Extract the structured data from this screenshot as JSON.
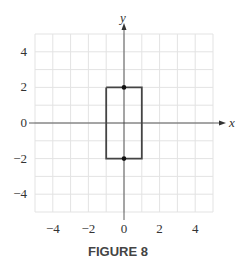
{
  "caption": "FIGURE 8",
  "chart_data": {
    "type": "line",
    "title": "FIGURE 8",
    "xlabel": "x",
    "ylabel": "y",
    "xlim": [
      -5,
      5
    ],
    "ylim": [
      -5,
      5
    ],
    "grid": true,
    "x_ticks": [
      "-4",
      "-2",
      "0",
      "2",
      "4"
    ],
    "y_ticks": [
      "4",
      "2",
      "0",
      "-2",
      "-4"
    ],
    "series": [
      {
        "name": "rectangle",
        "x": [
          -1,
          1,
          1,
          -1,
          -1
        ],
        "y": [
          2,
          2,
          -2,
          -2,
          2
        ]
      },
      {
        "name": "points",
        "x": [
          0,
          0
        ],
        "y": [
          2,
          -2
        ]
      }
    ]
  }
}
